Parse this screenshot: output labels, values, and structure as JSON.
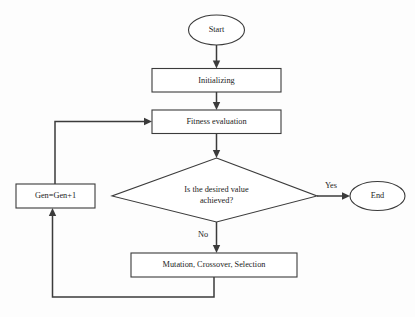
{
  "diagram": {
    "type": "flowchart",
    "background_color": "#fdfdfd",
    "line_color": "#3b3b3b",
    "text_color": "#1c1c1c",
    "node_fill": "#ffffff",
    "nodes": [
      {
        "id": "start",
        "shape": "ellipse",
        "label": "Start"
      },
      {
        "id": "initialize",
        "shape": "rectangle",
        "label": "Initializing"
      },
      {
        "id": "fitness",
        "shape": "rectangle",
        "label": "Fitness evaluation"
      },
      {
        "id": "decision",
        "shape": "diamond",
        "label_line1": "Is the desired value",
        "label_line2": "achieved?"
      },
      {
        "id": "end",
        "shape": "ellipse",
        "label": "End"
      },
      {
        "id": "generation",
        "shape": "rectangle",
        "label": "Gen=Gen+1"
      },
      {
        "id": "operators",
        "shape": "rectangle",
        "label": "Mutation, Crossover, Selection"
      }
    ],
    "edge_labels": {
      "yes": "Yes",
      "no": "No"
    }
  }
}
